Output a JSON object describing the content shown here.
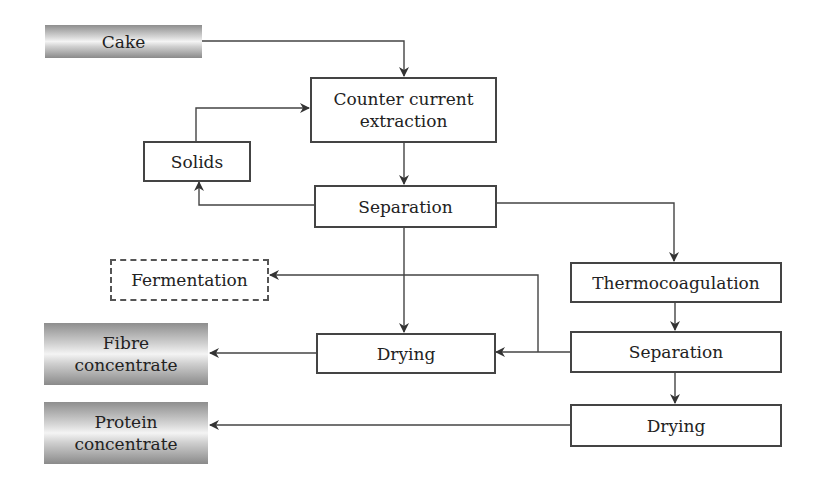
{
  "diagram": {
    "nodes": {
      "cake": {
        "label": "Cake",
        "style": "gradient"
      },
      "extraction": {
        "label": "Counter current\nextraction",
        "style": "solid"
      },
      "solids": {
        "label": "Solids",
        "style": "solid"
      },
      "separation1": {
        "label": "Separation",
        "style": "solid"
      },
      "fermentation": {
        "label": "Fermentation",
        "style": "dashed"
      },
      "thermocoagulation": {
        "label": "Thermocoagulation",
        "style": "solid"
      },
      "drying1": {
        "label": "Drying",
        "style": "solid"
      },
      "fibre": {
        "label": "Fibre\nconcentrate",
        "style": "gradient"
      },
      "separation2": {
        "label": "Separation",
        "style": "solid"
      },
      "drying2": {
        "label": "Drying",
        "style": "solid"
      },
      "protein": {
        "label": "Protein\nconcentrate",
        "style": "gradient"
      }
    },
    "edges": [
      {
        "from": "cake",
        "to": "extraction"
      },
      {
        "from": "extraction",
        "to": "separation1"
      },
      {
        "from": "separation1",
        "to": "solids"
      },
      {
        "from": "solids",
        "to": "extraction"
      },
      {
        "from": "separation1",
        "to": "drying1"
      },
      {
        "from": "separation1",
        "to": "thermocoagulation"
      },
      {
        "from": "thermocoagulation",
        "to": "separation2"
      },
      {
        "from": "separation2",
        "to": "drying1"
      },
      {
        "from": "separation2",
        "to": "fermentation"
      },
      {
        "from": "separation2",
        "to": "drying2"
      },
      {
        "from": "drying1",
        "to": "fibre"
      },
      {
        "from": "drying2",
        "to": "protein"
      }
    ],
    "colors": {
      "line": "#444444",
      "box_border": "#444444",
      "gradient_dark": "#8e8e8e",
      "gradient_light": "#f4f4f4"
    }
  }
}
